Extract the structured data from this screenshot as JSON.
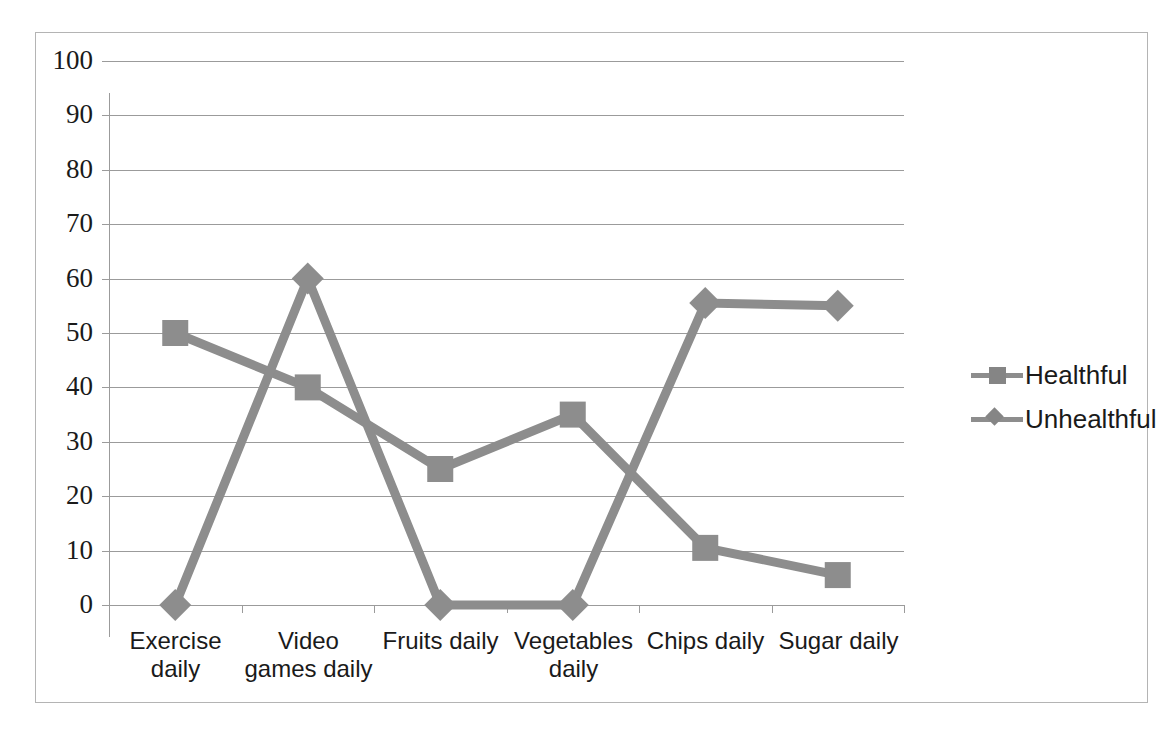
{
  "chart_data": {
    "type": "line",
    "title": "",
    "xlabel": "",
    "ylabel": "",
    "ylim": [
      0,
      100
    ],
    "ytick_step": 10,
    "yticks": [
      100,
      90,
      80,
      70,
      60,
      50,
      40,
      30,
      20,
      10,
      0
    ],
    "grid": true,
    "legend_position": "right",
    "categories": [
      "Exercise daily",
      "Video games daily",
      "Fruits daily",
      "Vegetables daily",
      "Chips daily",
      "Sugar daily"
    ],
    "series": [
      {
        "name": "Healthful",
        "marker": "square",
        "color": "#8d8d8d",
        "values": [
          50,
          40,
          25,
          35,
          10.5,
          5.5
        ]
      },
      {
        "name": "Unhealthful",
        "marker": "diamond",
        "color": "#8d8d8d",
        "values": [
          0,
          60,
          0,
          0,
          55.5,
          55
        ]
      }
    ]
  },
  "legend": {
    "entries": [
      {
        "label": "Healthful",
        "marker": "square"
      },
      {
        "label": "Unhealthful",
        "marker": "diamond"
      }
    ]
  },
  "colors": {
    "series_gray": "#8d8d8d",
    "gridline": "#9b9b9b",
    "border": "#b4b4b4",
    "text": "#1a1a1a",
    "background": "#ffffff"
  }
}
